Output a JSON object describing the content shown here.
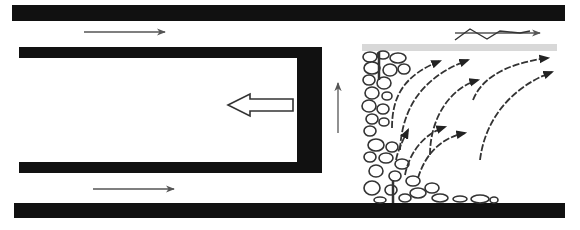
{
  "diagram": {
    "title": "",
    "colors": {
      "wall": "#111111",
      "background": "#ffffff",
      "flow_line": "#333333",
      "thin_arrow": "#555555",
      "dust_band": "#d8d8d8"
    },
    "walls": [
      {
        "id": "outer-top-wall",
        "x": 12,
        "y": 5,
        "w": 553,
        "h": 16
      },
      {
        "id": "inner-top-wall",
        "x": 19,
        "y": 47,
        "w": 303,
        "h": 11
      },
      {
        "id": "inner-bottom-wall",
        "x": 19,
        "y": 162,
        "w": 303,
        "h": 11
      },
      {
        "id": "support-face-wall",
        "x": 297,
        "y": 47,
        "w": 25,
        "h": 126
      },
      {
        "id": "outer-bottom-wall",
        "x": 14,
        "y": 203,
        "w": 551,
        "h": 15
      }
    ],
    "thin_arrows": [
      {
        "id": "top-channel-flow-arrow",
        "x1": 84,
        "y1": 32,
        "x2": 165,
        "y2": 32,
        "direction": "right"
      },
      {
        "id": "bottom-channel-flow-arrow",
        "x1": 93,
        "y1": 189,
        "x2": 174,
        "y2": 189,
        "direction": "right"
      },
      {
        "id": "face-upflow-arrow",
        "x1": 338,
        "y1": 133,
        "x2": 338,
        "y2": 83,
        "direction": "up"
      },
      {
        "id": "exit-flow-arrow",
        "x1": 455,
        "y1": 33,
        "x2": 540,
        "y2": 33,
        "direction": "right"
      }
    ],
    "hollow_arrow": {
      "id": "support-advance-arrow",
      "direction": "left",
      "tip_x": 228,
      "tail_x": 293,
      "cy": 105
    },
    "dust_band": {
      "x": 362,
      "y": 44,
      "w": 195,
      "h": 7
    },
    "flow_curves": [
      {
        "id": "flow-curve-1",
        "d": "M392 128 C392 95 405 75 440 61"
      },
      {
        "id": "flow-curve-2",
        "d": "M400 150 C402 110 420 78 468 60"
      },
      {
        "id": "flow-curve-3",
        "d": "M430 155 C430 118 450 88 478 80"
      },
      {
        "id": "flow-curve-4",
        "d": "M473 100 C480 82 500 64 548 58"
      },
      {
        "id": "flow-curve-5",
        "d": "M480 160 C485 120 510 88 552 72"
      },
      {
        "id": "flow-curve-6",
        "d": "M396 160 C398 150 402 142 408 130"
      },
      {
        "id": "flow-curve-7",
        "d": "M405 175 C408 158 420 135 445 127"
      },
      {
        "id": "flow-curve-8",
        "d": "M418 178 C425 155 440 138 465 133"
      }
    ],
    "turbulence_line": {
      "id": "turbulent-exit-line",
      "points": "455,40 470,29 487,39 500,31 520,33 530,31"
    },
    "gravel": [
      {
        "cx": 370,
        "cy": 57,
        "rx": 7,
        "ry": 5
      },
      {
        "cx": 383,
        "cy": 55,
        "rx": 6,
        "ry": 4
      },
      {
        "cx": 398,
        "cy": 58,
        "rx": 8,
        "ry": 5
      },
      {
        "cx": 372,
        "cy": 68,
        "rx": 8,
        "ry": 6
      },
      {
        "cx": 390,
        "cy": 70,
        "rx": 7,
        "ry": 6
      },
      {
        "cx": 404,
        "cy": 69,
        "rx": 6,
        "ry": 5
      },
      {
        "cx": 369,
        "cy": 80,
        "rx": 6,
        "ry": 5
      },
      {
        "cx": 384,
        "cy": 83,
        "rx": 7,
        "ry": 6
      },
      {
        "cx": 372,
        "cy": 93,
        "rx": 7,
        "ry": 6
      },
      {
        "cx": 387,
        "cy": 96,
        "rx": 5,
        "ry": 4
      },
      {
        "cx": 369,
        "cy": 106,
        "rx": 7,
        "ry": 6
      },
      {
        "cx": 383,
        "cy": 109,
        "rx": 6,
        "ry": 5
      },
      {
        "cx": 372,
        "cy": 119,
        "rx": 6,
        "ry": 5
      },
      {
        "cx": 384,
        "cy": 122,
        "rx": 5,
        "ry": 4
      },
      {
        "cx": 370,
        "cy": 131,
        "rx": 6,
        "ry": 5
      },
      {
        "cx": 376,
        "cy": 145,
        "rx": 8,
        "ry": 6
      },
      {
        "cx": 392,
        "cy": 147,
        "rx": 6,
        "ry": 5
      },
      {
        "cx": 370,
        "cy": 157,
        "rx": 6,
        "ry": 5
      },
      {
        "cx": 386,
        "cy": 158,
        "rx": 7,
        "ry": 5
      },
      {
        "cx": 402,
        "cy": 164,
        "rx": 7,
        "ry": 5
      },
      {
        "cx": 376,
        "cy": 171,
        "rx": 7,
        "ry": 6
      },
      {
        "cx": 395,
        "cy": 176,
        "rx": 6,
        "ry": 5
      },
      {
        "cx": 413,
        "cy": 181,
        "rx": 7,
        "ry": 5
      },
      {
        "cx": 372,
        "cy": 188,
        "rx": 8,
        "ry": 7
      },
      {
        "cx": 391,
        "cy": 190,
        "rx": 6,
        "ry": 5
      },
      {
        "cx": 418,
        "cy": 193,
        "rx": 8,
        "ry": 5
      },
      {
        "cx": 432,
        "cy": 188,
        "rx": 7,
        "ry": 5
      },
      {
        "cx": 440,
        "cy": 198,
        "rx": 8,
        "ry": 4
      },
      {
        "cx": 460,
        "cy": 199,
        "rx": 7,
        "ry": 3
      },
      {
        "cx": 480,
        "cy": 199,
        "rx": 9,
        "ry": 4
      },
      {
        "cx": 494,
        "cy": 200,
        "rx": 4,
        "ry": 3
      },
      {
        "cx": 405,
        "cy": 198,
        "rx": 6,
        "ry": 4
      },
      {
        "cx": 380,
        "cy": 200,
        "rx": 6,
        "ry": 3
      }
    ],
    "gravel_posts": [
      {
        "id": "gravel-post-upper",
        "x1": 379,
        "y1": 52,
        "x2": 379,
        "y2": 80
      },
      {
        "id": "gravel-post-lower",
        "x1": 393,
        "y1": 180,
        "x2": 393,
        "y2": 203
      }
    ]
  }
}
